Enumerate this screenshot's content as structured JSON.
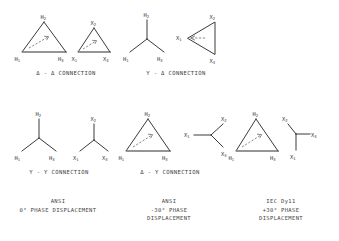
{
  "document": {
    "title": "Transformer Winding Connection Diagrams",
    "background_color": "#ffffff",
    "line_color": "#3a3a3a",
    "text_color": "#3f3f3f"
  },
  "figures": [
    {
      "id": "delta-delta",
      "connection_label": "Δ - Δ CONNECTION",
      "primary": {
        "shape": "delta",
        "orientation": "apex-up",
        "terminals": [
          "H2",
          "H1",
          "H3"
        ],
        "terminal_positions": [
          "top",
          "bottom-left",
          "bottom-right"
        ],
        "has_phase_arrow": true
      },
      "secondary": {
        "shape": "delta",
        "orientation": "apex-up",
        "terminals": [
          "X2",
          "X1",
          "X3"
        ],
        "terminal_positions": [
          "top",
          "bottom-left",
          "bottom-right"
        ],
        "has_phase_arrow": true
      }
    },
    {
      "id": "wye-delta",
      "connection_label": "Y - Δ CONNECTION",
      "primary": {
        "shape": "wye",
        "orientation": "apex-up",
        "terminals": [
          "H2",
          "H1",
          "H3"
        ],
        "terminal_positions": [
          "top",
          "bottom-left",
          "bottom-right"
        ],
        "has_phase_arrow": false
      },
      "secondary": {
        "shape": "delta",
        "orientation": "apex-left",
        "terminals": [
          "X2",
          "X1",
          "X3"
        ],
        "terminal_positions": [
          "top-right",
          "left",
          "bottom-right"
        ],
        "has_phase_arrow": true
      }
    },
    {
      "id": "wye-wye",
      "connection_label": "Y - Y CONNECTION",
      "primary": {
        "shape": "wye",
        "orientation": "apex-up",
        "terminals": [
          "H2",
          "H1",
          "H3"
        ],
        "terminal_positions": [
          "top",
          "bottom-left",
          "bottom-right"
        ],
        "has_phase_arrow": false
      },
      "secondary": {
        "shape": "wye",
        "orientation": "apex-up",
        "terminals": [
          "X2",
          "X1",
          "X3"
        ],
        "terminal_positions": [
          "top",
          "bottom-left",
          "bottom-right"
        ],
        "has_phase_arrow": false
      }
    },
    {
      "id": "delta-wye",
      "connection_label": "Δ - Y CONNECTION",
      "primary": {
        "shape": "delta",
        "orientation": "apex-up",
        "terminals": [
          "H2",
          "H1",
          "H3"
        ],
        "terminal_positions": [
          "top",
          "bottom-left",
          "bottom-right"
        ],
        "has_phase_arrow": true
      },
      "secondary": {
        "shape": "wye",
        "orientation": "apex-left",
        "terminals": [
          "X2",
          "X1",
          "X3"
        ],
        "terminal_positions": [
          "top-right",
          "left",
          "bottom-right"
        ],
        "has_phase_arrow": false
      }
    },
    {
      "id": "delta-wye-iec",
      "connection_label": "",
      "primary": {
        "shape": "delta",
        "orientation": "apex-up",
        "terminals": [
          "H2",
          "H1",
          "H3"
        ],
        "terminal_positions": [
          "top",
          "bottom-left",
          "bottom-right"
        ],
        "has_phase_arrow": true
      },
      "secondary": {
        "shape": "wye",
        "orientation": "apex-right",
        "terminals": [
          "X2",
          "X1",
          "X3"
        ],
        "terminal_positions": [
          "top-left",
          "bottom-left",
          "right"
        ],
        "has_phase_arrow": false
      }
    }
  ],
  "captions": [
    {
      "id": "caption-ansi-0",
      "lines": [
        "ANSI",
        "0° PHASE DISPLACEMENT"
      ]
    },
    {
      "id": "caption-ansi-minus30",
      "lines": [
        "ANSI",
        "-30° PHASE",
        "DISPLACEMENT"
      ]
    },
    {
      "id": "caption-iec-dy11",
      "lines": [
        "IEC  Dy11",
        "+30° PHASE",
        "DISPLACEMENT"
      ]
    }
  ]
}
